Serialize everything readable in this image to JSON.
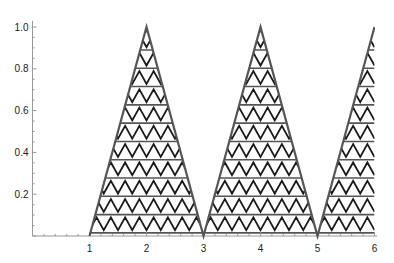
{
  "chart_data": {
    "type": "area",
    "title": "",
    "xlabel": "",
    "ylabel": "",
    "xlim": [
      0,
      6
    ],
    "ylim": [
      0,
      1.0
    ],
    "grid": false,
    "legend": null,
    "x_ticks": [
      1,
      2,
      3,
      4,
      5,
      6
    ],
    "x_tick_labels": [
      "1",
      "2",
      "3",
      "4",
      "5",
      "6"
    ],
    "y_ticks": [
      0.2,
      0.4,
      0.6,
      0.8,
      1.0
    ],
    "y_tick_labels": [
      "0.2",
      "0.4",
      "0.6",
      "0.8",
      "1.0"
    ],
    "series": [
      {
        "name": "triangle wave",
        "x": [
          1,
          2,
          3,
          4,
          5,
          6
        ],
        "y": [
          0,
          1,
          0,
          1,
          0,
          1
        ],
        "fill": "zigzag-hatch",
        "stroke": "#555555"
      }
    ],
    "hatch": {
      "horizontal_line_spacing": 0.0875,
      "zigzag_period_x": 0.25,
      "line_color": "#1a1a1a"
    }
  },
  "colors": {
    "background": "#ffffff",
    "axis": "#999999",
    "outline": "#555555",
    "hatch": "#1a1a1a"
  }
}
